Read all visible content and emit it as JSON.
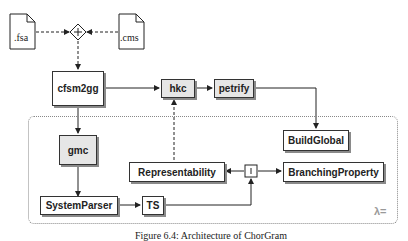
{
  "diagram": {
    "inputs": [
      {
        "id": "fsa",
        "label": ".fsa"
      },
      {
        "id": "cms",
        "label": ".cms"
      }
    ],
    "merge_node": {
      "symbol": "+"
    },
    "nodes": [
      {
        "id": "cfsm2gg",
        "label": "cfsm2gg"
      },
      {
        "id": "hkc",
        "label": "hkc"
      },
      {
        "id": "petrify",
        "label": "petrify"
      },
      {
        "id": "gmc",
        "label": "gmc"
      },
      {
        "id": "buildglobal",
        "label": "BuildGlobal"
      },
      {
        "id": "representability",
        "label": "Representability"
      },
      {
        "id": "branchingproperty",
        "label": "BranchingProperty"
      },
      {
        "id": "systemparser",
        "label": "SystemParser"
      },
      {
        "id": "ts",
        "label": "TS"
      }
    ],
    "fork_node": {
      "symbol": "|"
    },
    "haskell_logo": {
      "symbol": "λ="
    },
    "edges": [
      {
        "from": "fsa",
        "to": "merge",
        "style": "dashed"
      },
      {
        "from": "cms",
        "to": "merge",
        "style": "dashed"
      },
      {
        "from": "merge",
        "to": "cfsm2gg",
        "style": "dashed"
      },
      {
        "from": "cfsm2gg",
        "to": "hkc",
        "style": "solid"
      },
      {
        "from": "hkc",
        "to": "petrify",
        "style": "solid"
      },
      {
        "from": "petrify",
        "to": "buildglobal",
        "style": "solid"
      },
      {
        "from": "cfsm2gg",
        "to": "gmc",
        "style": "solid"
      },
      {
        "from": "gmc",
        "to": "systemparser",
        "style": "solid"
      },
      {
        "from": "systemparser",
        "to": "ts",
        "style": "solid"
      },
      {
        "from": "ts",
        "to": "fork",
        "style": "solid"
      },
      {
        "from": "fork",
        "to": "representability",
        "style": "solid"
      },
      {
        "from": "fork",
        "to": "branchingproperty",
        "style": "solid"
      },
      {
        "from": "representability",
        "to": "hkc",
        "style": "dashed"
      }
    ]
  },
  "caption": "Figure 6.4: Architecture of ChorGram"
}
